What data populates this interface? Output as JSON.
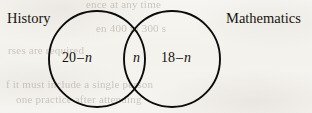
{
  "figure": {
    "type": "venn-diagram",
    "sets": 2,
    "background_color": "#f6f4f0",
    "stroke_color": "#0d0c0a",
    "text_color": "#13110d"
  },
  "labels": {
    "left_set": "History",
    "right_set": "Mathematics"
  },
  "regions": {
    "left_only": {
      "number": "20",
      "operator": "–",
      "variable": "n"
    },
    "intersection": {
      "variable": "n"
    },
    "right_only": {
      "number": "18",
      "operator": "–",
      "variable": "n"
    }
  },
  "geometry": {
    "left_circle": {
      "cx": 97,
      "cy": 59,
      "r": 48
    },
    "right_circle": {
      "cx": 172,
      "cy": 59,
      "r": 48
    },
    "stroke_width": 1.9
  },
  "background_ghost_text": [
    {
      "text": "ence at any time",
      "x": 86,
      "y": -2,
      "size": 11
    },
    {
      "text": "en 400 in 300 s",
      "x": 96,
      "y": 22,
      "size": 11
    },
    {
      "text": "rses are required",
      "x": 8,
      "y": 44,
      "size": 11
    },
    {
      "text": "f it must include a single person",
      "x": 6,
      "y": 78,
      "size": 11
    },
    {
      "text": "one practice after attending",
      "x": 16,
      "y": 93,
      "size": 11
    }
  ]
}
